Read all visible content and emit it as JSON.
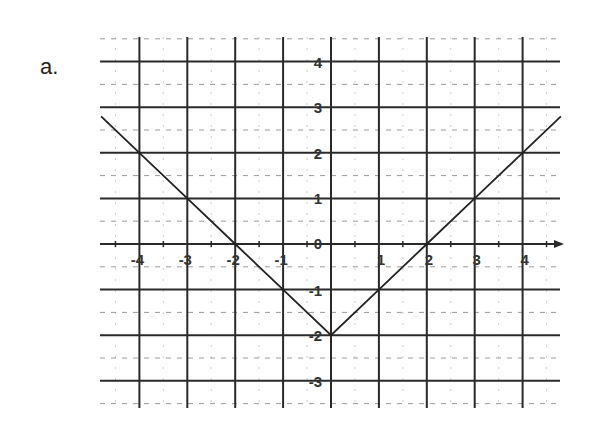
{
  "problem_label": "a.",
  "chart_data": {
    "type": "line",
    "title": "",
    "function": "y = |x| - 2",
    "xlabel": "",
    "ylabel": "",
    "xlim": [
      -4.8,
      4.8
    ],
    "ylim": [
      -3.5,
      4.5
    ],
    "grid": true,
    "x_ticks": [
      -4,
      -3,
      -2,
      -1,
      1,
      2,
      3,
      4
    ],
    "y_ticks": [
      4,
      3,
      2,
      1,
      0,
      -1,
      -2,
      -3
    ],
    "x_tick_labels": [
      "-4",
      "-3",
      "-2",
      "-1",
      "1",
      "2",
      "3",
      "4"
    ],
    "y_tick_labels": [
      "4",
      "3",
      "2",
      "1",
      "0",
      "-1",
      "-2",
      "-3"
    ],
    "series": [
      {
        "name": "y = |x| - 2",
        "x": [
          -4.8,
          -4,
          -3,
          -2,
          -1,
          0,
          1,
          2,
          3,
          4,
          4.8
        ],
        "y": [
          2.8,
          2,
          1,
          0,
          -1,
          -2,
          -1,
          0,
          1,
          2,
          2.8
        ]
      }
    ],
    "colors": {
      "line": "#222222",
      "grid_major": "#2a2a2a",
      "grid_minor": "#9a9a9a"
    }
  }
}
